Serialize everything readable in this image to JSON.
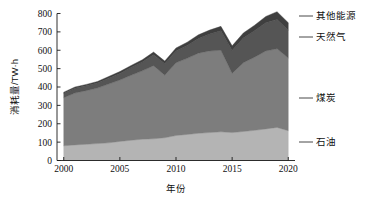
{
  "chart_data": {
    "type": "area",
    "stacked": true,
    "title": "",
    "subtitle": "",
    "xlabel": "年份",
    "ylabel": "消耗量/TW·h",
    "xlim": [
      1999.4,
      2020.6
    ],
    "ylim": [
      0,
      800
    ],
    "grid": false,
    "legend_position": "right-outside-annotations",
    "x": [
      2000,
      2001,
      2002,
      2003,
      2004,
      2005,
      2006,
      2007,
      2008,
      2009,
      2010,
      2011,
      2012,
      2013,
      2014,
      2015,
      2016,
      2017,
      2018,
      2019,
      2020
    ],
    "xticks": [
      2000,
      2005,
      2010,
      2015,
      2020
    ],
    "xtick_labels": [
      "2000",
      "2005",
      "2010",
      "2015",
      "2020"
    ],
    "yticks": [
      0,
      100,
      200,
      300,
      400,
      500,
      600,
      700,
      800
    ],
    "ytick_labels": [
      "0",
      "100",
      "200",
      "300",
      "400",
      "500",
      "600",
      "700",
      "800"
    ],
    "series": [
      {
        "name": "石油",
        "name_en": "Oil",
        "color": "#b4b4b4",
        "values": [
          80,
          85,
          88,
          92,
          96,
          104,
          110,
          116,
          118,
          124,
          136,
          142,
          148,
          152,
          156,
          152,
          158,
          164,
          172,
          180,
          162
        ]
      },
      {
        "name": "煤炭",
        "name_en": "Coal",
        "color": "#7d7d7d",
        "values": [
          262,
          282,
          292,
          302,
          320,
          334,
          354,
          372,
          398,
          340,
          396,
          414,
          436,
          444,
          444,
          322,
          374,
          398,
          424,
          428,
          396
        ]
      },
      {
        "name": "天然气",
        "name_en": "Natural Gas",
        "color": "#555555",
        "values": [
          24,
          26,
          27,
          28,
          32,
          36,
          42,
          48,
          60,
          62,
          64,
          70,
          80,
          92,
          106,
          124,
          134,
          144,
          154,
          160,
          152
        ]
      },
      {
        "name": "其他能源",
        "name_en": "Other Energy",
        "color": "#3f3f3f",
        "values": [
          6,
          7,
          7,
          8,
          9,
          10,
          11,
          12,
          14,
          15,
          16,
          18,
          20,
          22,
          24,
          26,
          28,
          30,
          34,
          42,
          40
        ]
      }
    ],
    "totals": [
      372,
      400,
      414,
      430,
      457,
      484,
      517,
      548,
      590,
      541,
      612,
      644,
      684,
      710,
      730,
      624,
      694,
      736,
      784,
      810,
      750
    ],
    "annotations": [
      {
        "label": "其他能源",
        "series_index": 3
      },
      {
        "label": "天然气",
        "series_index": 2
      },
      {
        "label": "煤炭",
        "series_index": 1
      },
      {
        "label": "石油",
        "series_index": 0
      }
    ]
  },
  "axes": {
    "ylabel": "消耗量/TW·h",
    "xlabel": "年份"
  },
  "legend": {
    "items": [
      {
        "label": "其他能源"
      },
      {
        "label": "天然气"
      },
      {
        "label": "煤炭"
      },
      {
        "label": "石油"
      }
    ]
  },
  "colors": {
    "oil": "#b4b4b4",
    "coal": "#7d7d7d",
    "gas": "#555555",
    "other": "#3f3f3f",
    "axis": "#1a1a1a",
    "text": "#111111",
    "background": "#ffffff"
  }
}
